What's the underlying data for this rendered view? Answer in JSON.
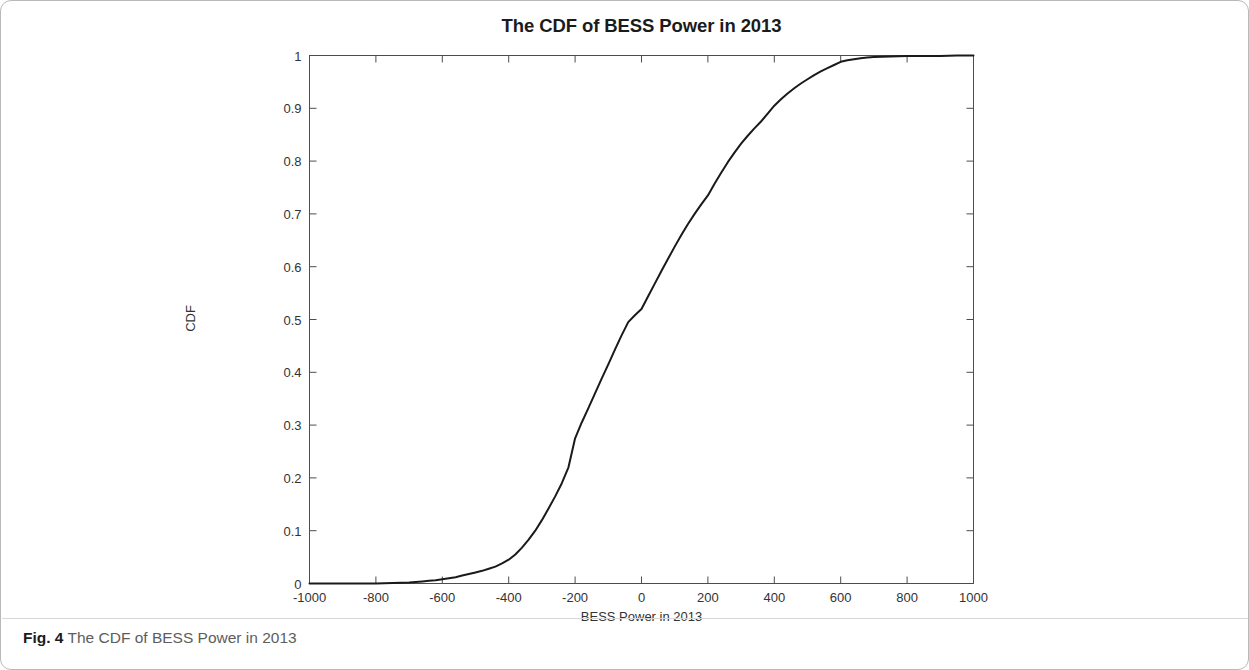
{
  "figure": {
    "caption_label": "Fig. 4",
    "caption_text": "The CDF of BESS Power in 2013"
  },
  "chart_data": {
    "type": "line",
    "title": "The CDF of BESS Power in 2013",
    "xlabel": "BESS Power in 2013",
    "ylabel": "CDF",
    "xlim": [
      -1000,
      1000
    ],
    "ylim": [
      0,
      1
    ],
    "xticks": [
      -1000,
      -800,
      -600,
      -400,
      -200,
      0,
      200,
      400,
      600,
      800,
      1000
    ],
    "xtick_labels": [
      "-1000",
      "-800",
      "-600",
      "-400",
      "-200",
      "0",
      "200",
      "400",
      "600",
      "800",
      "1000"
    ],
    "yticks": [
      0,
      0.1,
      0.2,
      0.3,
      0.4,
      0.5,
      0.6,
      0.7,
      0.8,
      0.9,
      1
    ],
    "ytick_labels": [
      "0",
      "0.1",
      "0.2",
      "0.3",
      "0.4",
      "0.5",
      "0.6",
      "0.7",
      "0.8",
      "0.9",
      "1"
    ],
    "grid": false,
    "legend": false,
    "line_color": "#1a1a1a",
    "line_width": 2.0,
    "series": [
      {
        "name": "CDF of BESS Power in 2013",
        "x": [
          -1000,
          -950,
          -900,
          -850,
          -800,
          -750,
          -700,
          -680,
          -660,
          -640,
          -620,
          -600,
          -580,
          -560,
          -540,
          -520,
          -500,
          -480,
          -460,
          -440,
          -420,
          -400,
          -380,
          -360,
          -340,
          -320,
          -300,
          -280,
          -260,
          -240,
          -220,
          -200,
          -180,
          -160,
          -140,
          -120,
          -100,
          -80,
          -60,
          -40,
          -20,
          0,
          20,
          40,
          60,
          80,
          100,
          120,
          140,
          160,
          180,
          200,
          220,
          240,
          260,
          280,
          300,
          320,
          340,
          360,
          380,
          400,
          420,
          440,
          460,
          480,
          500,
          520,
          540,
          560,
          580,
          600,
          620,
          640,
          660,
          680,
          700,
          750,
          800,
          850,
          900,
          950,
          1000
        ],
        "y": [
          0.0,
          0.0,
          0.0,
          0.0,
          0.0,
          0.001,
          0.002,
          0.003,
          0.004,
          0.005,
          0.006,
          0.008,
          0.01,
          0.012,
          0.015,
          0.018,
          0.021,
          0.024,
          0.028,
          0.032,
          0.038,
          0.045,
          0.055,
          0.068,
          0.083,
          0.1,
          0.12,
          0.142,
          0.165,
          0.19,
          0.22,
          0.275,
          0.305,
          0.332,
          0.36,
          0.388,
          0.415,
          0.443,
          0.47,
          0.495,
          0.508,
          0.52,
          0.544,
          0.568,
          0.592,
          0.615,
          0.638,
          0.66,
          0.681,
          0.7,
          0.718,
          0.735,
          0.757,
          0.778,
          0.798,
          0.816,
          0.833,
          0.848,
          0.862,
          0.875,
          0.89,
          0.905,
          0.917,
          0.928,
          0.938,
          0.947,
          0.955,
          0.963,
          0.97,
          0.976,
          0.982,
          0.988,
          0.991,
          0.993,
          0.995,
          0.996,
          0.997,
          0.998,
          0.999,
          0.999,
          0.999,
          1.0,
          1.0
        ]
      }
    ]
  }
}
